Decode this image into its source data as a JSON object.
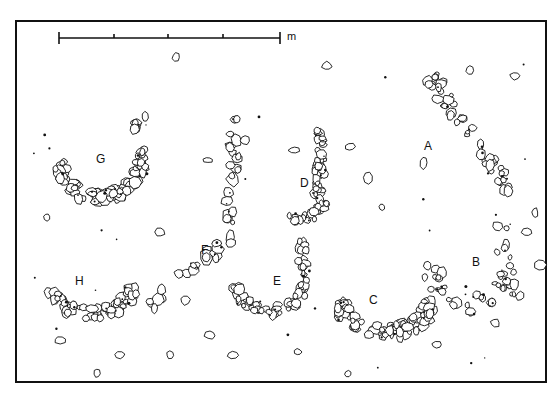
{
  "figure": {
    "type": "archaeological site plan",
    "ink_color": "#111111",
    "background": "#ffffff"
  },
  "scale_bar": {
    "unit_label": "m",
    "segments": 4
  },
  "structures": [
    {
      "id": "A",
      "label": "A",
      "form": "linear stone alignment"
    },
    {
      "id": "B",
      "label": "B",
      "form": "scattered stone arc"
    },
    {
      "id": "C",
      "label": "C",
      "form": "stone arc"
    },
    {
      "id": "D",
      "label": "D",
      "form": "stone arc"
    },
    {
      "id": "E",
      "label": "E",
      "form": "stone arc"
    },
    {
      "id": "F",
      "label": "F",
      "form": "stone alignment"
    },
    {
      "id": "G",
      "label": "G",
      "form": "stone arc"
    },
    {
      "id": "H",
      "label": "H",
      "form": "stone arc"
    }
  ]
}
